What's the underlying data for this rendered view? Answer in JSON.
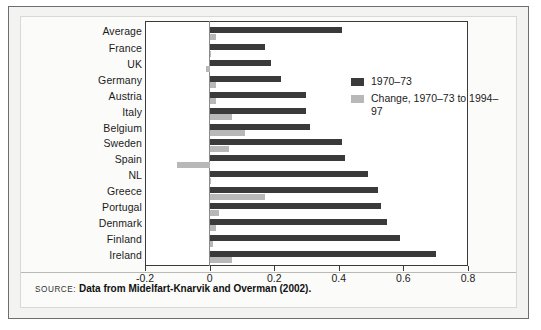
{
  "figure": {
    "source_kicker": "SOURCE:",
    "source_text": "Data from Midelfart-Knarvik and Overman (2002)."
  },
  "legend": {
    "items": [
      {
        "label": "1970–73",
        "color": "#3a3a3a",
        "swatch": "dark"
      },
      {
        "label": "Change, 1970–73 to 1994–97",
        "color": "#b8b8b8",
        "swatch": "grey"
      }
    ]
  },
  "chart_data": {
    "type": "bar",
    "orientation": "horizontal",
    "title": "",
    "xlabel": "",
    "ylabel": "",
    "xlim": [
      -0.2,
      0.8
    ],
    "xticks": [
      -0.2,
      0,
      0.2,
      0.4,
      0.6,
      0.8
    ],
    "xtick_labels": [
      "-0.2",
      "0",
      "0.2",
      "0.4",
      "0.6",
      "0.8"
    ],
    "grid": false,
    "legend_position": "upper right inside",
    "categories": [
      "Average",
      "France",
      "UK",
      "Germany",
      "Austria",
      "Italy",
      "Belgium",
      "Sweden",
      "Spain",
      "NL",
      "Greece",
      "Portugal",
      "Denmark",
      "Finland",
      "Ireland"
    ],
    "series": [
      {
        "name": "1970–73",
        "color": "#3a3a3a",
        "values": [
          0.41,
          0.17,
          0.19,
          0.22,
          0.3,
          0.3,
          0.31,
          0.41,
          0.42,
          0.49,
          0.52,
          0.53,
          0.55,
          0.59,
          0.7
        ]
      },
      {
        "name": "Change, 1970–73 to 1994–97",
        "color": "#b8b8b8",
        "values": [
          0.02,
          0.0,
          -0.01,
          0.02,
          0.02,
          0.07,
          0.11,
          0.06,
          -0.1,
          0.005,
          0.17,
          0.03,
          0.02,
          0.01,
          0.07
        ]
      }
    ]
  }
}
